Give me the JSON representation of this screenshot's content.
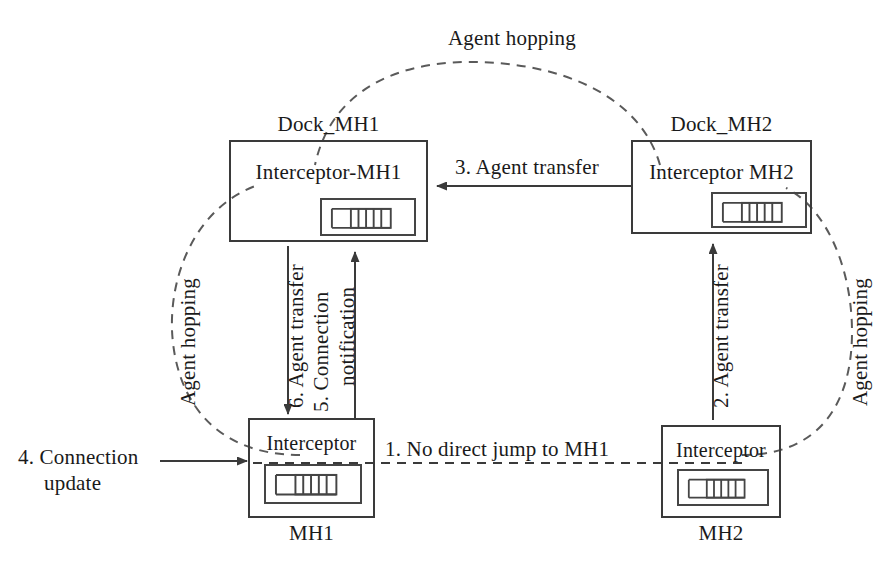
{
  "figure": {
    "stroke_color": "#3a3a3a",
    "dash_color": "#5a5a5a",
    "background": "#ffffff"
  },
  "nodes": {
    "dock_mh1": {
      "caption": "Dock_MH1",
      "inner_label": "Interceptor-MH1",
      "agent_icon": "agent-stack-icon"
    },
    "dock_mh2": {
      "caption": "Dock_MH2",
      "inner_label": "Interceptor MH2",
      "agent_icon": "agent-stack-icon"
    },
    "mh1": {
      "caption": "MH1",
      "inner_label": "Interceptor",
      "agent_icon": "agent-stack-icon"
    },
    "mh2": {
      "caption": "MH2",
      "inner_label": "Interceptor",
      "agent_icon": "agent-stack-icon"
    }
  },
  "edges": {
    "hop_top": {
      "label": "Agent hopping",
      "style": "dashed"
    },
    "hop_left": {
      "label": "Agent hopping",
      "style": "dashed"
    },
    "hop_right": {
      "label": "Agent hopping",
      "style": "dashed"
    },
    "step1": {
      "label": "1. No direct jump to MH1",
      "style": "dashed"
    },
    "step2": {
      "label": "2. Agent transfer",
      "style": "solid"
    },
    "step3": {
      "label": "3. Agent transfer",
      "style": "solid"
    },
    "step4": {
      "label_line1": "4. Connection",
      "label_line2": "update",
      "style": "solid"
    },
    "step5": {
      "label_line1": "5. Connection",
      "label_line2": "notification",
      "style": "solid"
    },
    "step6": {
      "label": "6. Agent transfer",
      "style": "solid"
    }
  }
}
